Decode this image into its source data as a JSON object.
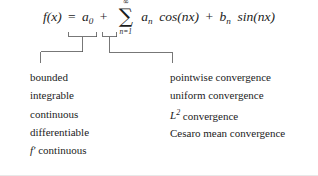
{
  "figure": {
    "type": "math-diagram"
  },
  "formula": {
    "lhs": "f(x)",
    "equals": "=",
    "a0": "a",
    "a0_sub": "0",
    "plus": "+",
    "sum_symbol": "∑",
    "sum_upper": "∞",
    "sum_lower": "n=1",
    "term_a": "a",
    "term_a_sub": "n",
    "cos": "cos(nx)",
    "mid_plus": "+",
    "term_b": "b",
    "term_b_sub": "n",
    "sin": "sin(nx)"
  },
  "columns": {
    "left": {
      "name": "function-properties",
      "items": [
        "bounded",
        "integrable",
        "continuous",
        "differentiable",
        "continuous"
      ],
      "last_item_prefix": "f′"
    },
    "right": {
      "name": "convergence-modes",
      "items": [
        "pointwise convergence",
        "uniform convergence",
        "convergence",
        "Cesaro mean convergence"
      ],
      "l2_prefix": "L",
      "l2_exponent": "2"
    }
  },
  "colors": {
    "ink": "#1c1c1c",
    "rule": "#555555",
    "background": "#ffffff"
  }
}
